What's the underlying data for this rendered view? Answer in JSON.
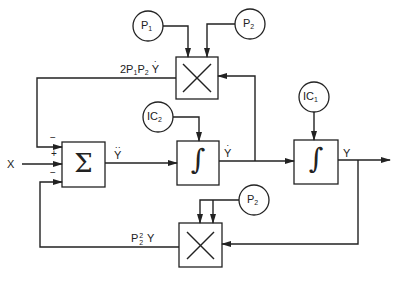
{
  "diagram": {
    "title": "",
    "type": "analog computer block diagram",
    "line_color": "#222222",
    "background": "#ffffff",
    "blocks": {
      "summer": {
        "symbol": "Σ",
        "label": "summer"
      },
      "integrator_1": {
        "symbol": "∫",
        "label": "integrator"
      },
      "integrator_2": {
        "symbol": "∫",
        "label": "integrator"
      },
      "multiplier_top": {
        "symbol": "×",
        "label": "multiplier"
      },
      "multiplier_bottom": {
        "symbol": "×",
        "label": "multiplier"
      }
    },
    "sources": {
      "p1": {
        "base": "P",
        "sub": "1"
      },
      "p2_top": {
        "base": "P",
        "sub": "2"
      },
      "p2_bottom": {
        "base": "P",
        "sub": "2"
      },
      "ic1": {
        "base": "IC",
        "sub": "1"
      },
      "ic2": {
        "base": "IC",
        "sub": "2"
      }
    },
    "signals": {
      "input": "X",
      "y_ddot": {
        "base": "Y",
        "dots": "··"
      },
      "y_dot": {
        "base": "Y",
        "dots": "·"
      },
      "y": "Y",
      "top_feedback": {
        "prefix": "2P",
        "s1": "1",
        "mid": "P",
        "s2": "2",
        "var": "Y",
        "dots": "·"
      },
      "bottom_feedback": {
        "base": "P",
        "sup": "2",
        "sub": "2",
        "var": "Y"
      }
    },
    "summer_signs": {
      "top": "−",
      "middle": "+",
      "bottom": "−"
    }
  }
}
